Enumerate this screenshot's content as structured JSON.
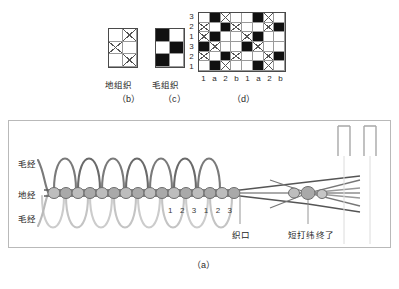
{
  "figure": {
    "sub_labels": {
      "a": "（a）",
      "b": "（b）",
      "c": "（c）",
      "d": "（d）"
    },
    "weave_names": {
      "ground": "地组织",
      "pile": "毛组织"
    }
  },
  "grid_b": {
    "name": "地组织",
    "cols": 2,
    "rows": 3,
    "cells": [
      [
        "empty",
        "cross"
      ],
      [
        "cross",
        "empty"
      ],
      [
        "empty",
        "cross"
      ]
    ]
  },
  "grid_c": {
    "name": "毛组织",
    "cols": 2,
    "rows": 3,
    "cells": [
      [
        "black",
        "empty"
      ],
      [
        "empty",
        "black"
      ],
      [
        "black",
        "empty"
      ]
    ]
  },
  "grid_d": {
    "cols": 8,
    "rows": 6,
    "row_labels": [
      "3",
      "2",
      "1",
      "3",
      "2",
      "1"
    ],
    "col_labels": [
      "1",
      "a",
      "2",
      "b",
      "1",
      "a",
      "2",
      "b"
    ],
    "cells": [
      [
        "empty",
        "black",
        "cross",
        "empty",
        "empty",
        "black",
        "cross",
        "empty"
      ],
      [
        "cross",
        "empty",
        "black",
        "cross",
        "empty",
        "empty",
        "cross",
        "black"
      ],
      [
        "cross",
        "black",
        "empty",
        "empty",
        "cross",
        "black",
        "empty",
        "empty"
      ],
      [
        "black",
        "cross",
        "empty",
        "empty",
        "black",
        "cross",
        "empty",
        "empty"
      ],
      [
        "cross",
        "empty",
        "black",
        "cross",
        "empty",
        "empty",
        "cross",
        "black"
      ],
      [
        "empty",
        "black",
        "cross",
        "empty",
        "empty",
        "black",
        "cross",
        "empty"
      ]
    ]
  },
  "diagram_a": {
    "labels": {
      "pile_warp_top": "毛经",
      "ground_warp": "地经",
      "pile_warp_bottom": "毛经",
      "fell": "织口",
      "short_beat_end": "短打纬终了"
    },
    "weft_numbers": [
      "1",
      "2",
      "3",
      "1",
      "2",
      "3"
    ]
  },
  "colors": {
    "black_cell": "#111111",
    "grid_line": "#9a9a9a",
    "border": "#4a4a4a",
    "warp_dark": "#6f6f6f",
    "warp_light": "#c2c2c2",
    "weft_fill": "#b5b5b5",
    "panel_border": "#b9b9b9"
  }
}
